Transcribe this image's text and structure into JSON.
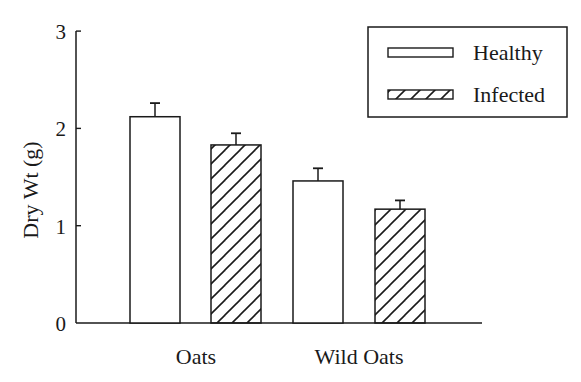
{
  "chart_data": {
    "type": "bar",
    "title": "",
    "xlabel": "",
    "ylabel": "Dry Wt (g)",
    "ylim": [
      0,
      3
    ],
    "yticks": [
      0,
      1,
      2,
      3
    ],
    "ytick_labels": [
      "0",
      "1",
      "2",
      "3"
    ],
    "grid": false,
    "legend_position": "upper right",
    "categories": [
      "Oats",
      "Wild Oats"
    ],
    "series": [
      {
        "name": "Healthy",
        "pattern": "none",
        "values": [
          2.12,
          1.46
        ],
        "error": [
          0.14,
          0.13
        ]
      },
      {
        "name": "Infected",
        "pattern": "diagonal-hatch",
        "values": [
          1.83,
          1.17
        ],
        "error": [
          0.12,
          0.09
        ]
      }
    ]
  },
  "legend": {
    "items": [
      {
        "label": "Healthy"
      },
      {
        "label": "Infected"
      }
    ]
  },
  "colors": {
    "ink": "#1a1a1a",
    "fill": "#ffffff"
  }
}
